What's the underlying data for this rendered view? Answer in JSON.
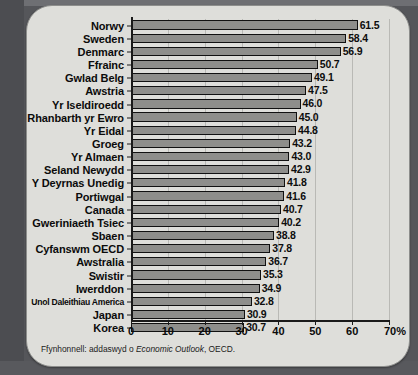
{
  "panel": {
    "source_prefix": "Ffynhonnell: addaswyd o ",
    "source_italic": "Economic Outlook",
    "source_suffix": ", OECD."
  },
  "colors": {
    "bar_fill": "#8e8e8b",
    "bar_border": "#111111",
    "panel_bg": "#dededa",
    "backdrop": "#55565a",
    "gridline": "#b9b9b5",
    "axis": "#1a1a1a",
    "text": "#0b0b0b"
  },
  "chart_data": {
    "type": "bar",
    "orientation": "horizontal",
    "title": "",
    "subtitle": "",
    "xlabel": "",
    "ylabel": "",
    "xlim": [
      0,
      70
    ],
    "xticks": [
      0,
      10,
      20,
      30,
      40,
      50,
      60,
      70
    ],
    "xtick_labels": [
      "0",
      "10",
      "20",
      "30",
      "40",
      "50",
      "60",
      "70%"
    ],
    "grid": true,
    "legend": false,
    "legend_position": "none",
    "value_labels": true,
    "value_label_format": "one-decimal",
    "categories": [
      "Norwy",
      "Sweden",
      "Denmarc",
      "Ffrainc",
      "Gwlad Belg",
      "Awstria",
      "Yr Iseldiroedd",
      "Rhanbarth yr Ewro",
      "Yr Eidal",
      "Groeg",
      "Yr Almaen",
      "Seland Newydd",
      "Y Deyrnas Unedig",
      "Portiwgal",
      "Canada",
      "Gweriniaeth Tsiec",
      "Sbaen",
      "Cyfanswm OECD",
      "Awstralia",
      "Swistir",
      "Iwerddon",
      "Unol Daleithiau America",
      "Japan",
      "Korea"
    ],
    "values": [
      61.5,
      58.4,
      56.9,
      50.7,
      49.1,
      47.5,
      46.0,
      45.0,
      44.8,
      43.2,
      43.0,
      42.9,
      41.8,
      41.6,
      40.7,
      40.2,
      38.8,
      37.8,
      36.7,
      35.3,
      34.9,
      32.8,
      30.9,
      30.7
    ],
    "value_texts": [
      "61.5",
      "58.4",
      "56.9",
      "50.7",
      "49.1",
      "47.5",
      "46.0",
      "45.0",
      "44.8",
      "43.2",
      "43.0",
      "42.9",
      "41.8",
      "41.6",
      "40.7",
      "40.2",
      "38.8",
      "37.8",
      "36.7",
      "35.3",
      "34.9",
      "32.8",
      "30.9",
      "30.7"
    ],
    "source": "Ffynhonnell: addaswyd o Economic Outlook, OECD."
  }
}
